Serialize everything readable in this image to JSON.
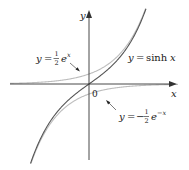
{
  "chart_data": {
    "type": "line",
    "title": "",
    "xlabel": "x",
    "ylabel": "y",
    "origin_label": "0",
    "grid": false,
    "xlim": [
      -3.1,
      3.1
    ],
    "ylim": [
      -3.7,
      3.6
    ],
    "series": [
      {
        "name": "y = sinh x",
        "function": "sinh(x)",
        "color": "#555555"
      },
      {
        "name": "y = 1/2 e^x",
        "function": "0.5*exp(x)",
        "color": "#bdbdbd"
      },
      {
        "name": "y = -1/2 e^-x",
        "function": "-0.5*exp(-x)",
        "color": "#bdbdbd"
      }
    ],
    "annotations": [
      {
        "text": "y = ½ eˣ",
        "points_to": "y = 1/2 e^x"
      },
      {
        "text": "y = sinh x",
        "points_to": "y = sinh x"
      },
      {
        "text": "y = −½ e⁻ˣ",
        "points_to": "y = -1/2 e^-x"
      }
    ]
  },
  "labels": {
    "axis_x": "x",
    "axis_y": "y",
    "origin": "0",
    "ex": {
      "y": "y",
      "eq": "=",
      "num": "1",
      "den": "2",
      "e": "e",
      "exp": "x"
    },
    "sinh": {
      "y": "y",
      "eq": "=",
      "fn": "sinh",
      "var": "x"
    },
    "emx": {
      "y": "y",
      "eq": "=",
      "minus": "−",
      "num": "1",
      "den": "2",
      "e": "e",
      "exp": "−x"
    }
  },
  "colors": {
    "axis": "#333333",
    "sinh": "#555555",
    "half_exp": "#bdbdbd",
    "text": "#1a1a1a"
  }
}
